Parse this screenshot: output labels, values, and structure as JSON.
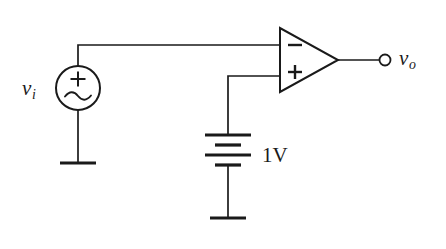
{
  "figure": {
    "background_color": "#ffffff",
    "line_color": "#1a1a1a",
    "width": 446,
    "height": 249
  },
  "labels": {
    "input_source": "v",
    "input_source_subscript": "i",
    "output_terminal": "v",
    "output_terminal_subscript": "o",
    "battery_value": "1V"
  },
  "components": {
    "ac_source": {
      "name": "ac-voltage-source",
      "label": "v_i",
      "polarity_marking": "+",
      "waveform_glyph": "sine",
      "center_x": 78,
      "center_y": 88,
      "radius": 22
    },
    "op_amp": {
      "name": "operational-amplifier",
      "inverting_input_sign": "−",
      "noninverting_input_sign": "+",
      "apex_x": 338,
      "apex_y": 60,
      "left_x": 280,
      "top_y": 28,
      "bottom_y": 92
    },
    "battery": {
      "name": "dc-battery",
      "value": "1V",
      "cell_count": 2,
      "plate_pattern": [
        "long",
        "short",
        "long",
        "short"
      ],
      "branch_x": 228,
      "top_plate_y": 135,
      "bottom_plate_y": 165
    },
    "output_terminal": {
      "name": "output-terminal",
      "label": "v_o",
      "x": 385,
      "y": 60,
      "radius": 5.5
    },
    "grounds": [
      {
        "name": "ground-source",
        "x": 78,
        "y": 163
      },
      {
        "name": "ground-battery",
        "x": 228,
        "y": 218
      }
    ]
  },
  "connections": [
    {
      "from": "ac-voltage-source-top",
      "to": "op-amp-inverting-input"
    },
    {
      "from": "ac-voltage-source-bottom",
      "to": "ground-source"
    },
    {
      "from": "op-amp-noninverting-input",
      "to": "battery-positive"
    },
    {
      "from": "battery-negative",
      "to": "ground-battery"
    },
    {
      "from": "op-amp-output",
      "to": "output-terminal"
    }
  ]
}
